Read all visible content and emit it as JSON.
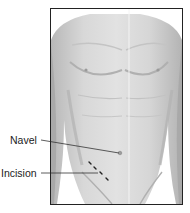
{
  "diagram": {
    "labels": [
      {
        "text": "Navel",
        "target": "navel"
      },
      {
        "text": "Incision",
        "target": "incision"
      }
    ],
    "colors": {
      "skin_light": "#e4e4e4",
      "skin_mid": "#c8c8c8",
      "skin_shadow": "#a8a8a8",
      "frame": "#222222",
      "incision": "#222222"
    }
  }
}
